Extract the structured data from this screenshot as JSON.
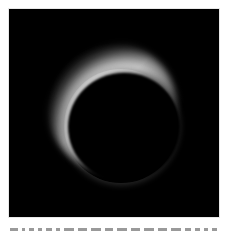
{
  "figure": {
    "background_color": "#000000",
    "crescent_color": "#f0f0f0",
    "disc": {
      "center": [
        124,
        127
      ],
      "radius": 55
    }
  },
  "caption": {
    "text": "",
    "clipped": true,
    "color": "#9a9a9a"
  }
}
